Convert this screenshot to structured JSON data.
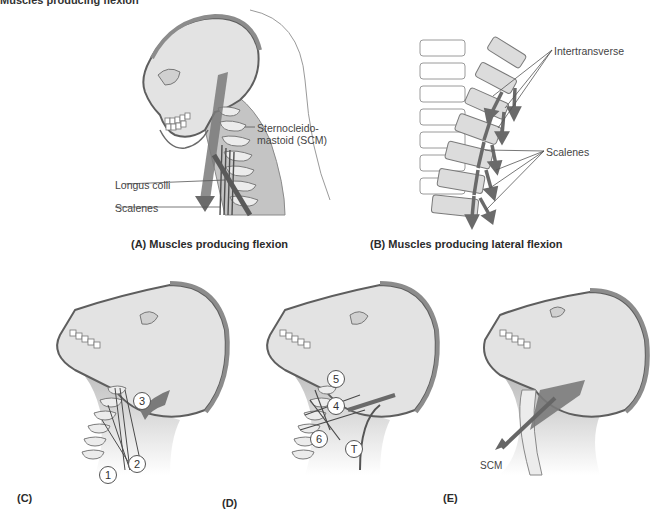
{
  "figure": {
    "header_cutoff_text": "Muscles producing flexion",
    "panels": {
      "A": {
        "caption": "(A) Muscles producing flexion",
        "labels": {
          "scm_line1": "Sternocleido-",
          "scm_line2": "mastoid (SCM)",
          "longus_colli": "Longus colli",
          "scalenes": "Scalenes"
        }
      },
      "B": {
        "caption": "(B) Muscles producing lateral flexion",
        "labels": {
          "intertransverse": "Intertransverse",
          "scalenes": "Scalenes"
        }
      },
      "C": {
        "caption": "(C)",
        "markers": [
          "1",
          "2",
          "3"
        ]
      },
      "D": {
        "caption": "(D)",
        "markers": [
          "5",
          "4",
          "6",
          "T"
        ]
      },
      "E": {
        "caption": "(E)",
        "labels": {
          "scm": "SCM"
        }
      }
    },
    "colors": {
      "bone_fill": "#e6e6e6",
      "outline": "#6f6f6f",
      "muscle_dark": "#6e6e6e",
      "soft_tissue": "#b9b9b9",
      "background": "#ffffff"
    }
  }
}
